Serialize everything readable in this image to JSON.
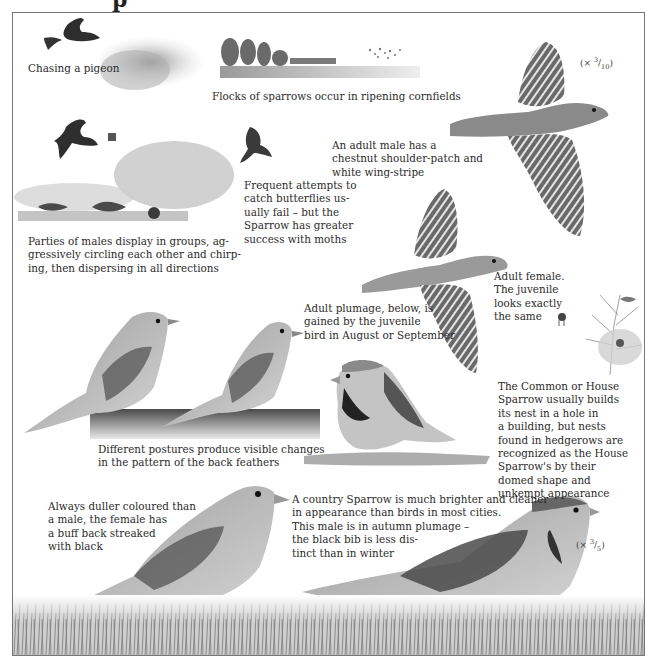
{
  "page": {
    "title_fragment": "p",
    "kind": "Field guide illustrated plate: House Sparrow"
  },
  "captions": {
    "chasing_pigeon": "Chasing a pigeon",
    "flocks_cornfields": "Flocks of sparrows occur in ripening cornfields",
    "adult_male_flight": [
      "An adult male has a",
      "chestnut shoulder-patch and",
      "white wing-stripe"
    ],
    "butterflies": [
      "Frequent attempts to",
      "catch butterflies us-",
      "ually fail – but the",
      "Sparrow has greater",
      "success with moths"
    ],
    "parties_males": [
      "Parties of males display in groups, ag-",
      "gressively circling each other and chirp-",
      "ing, then dispersing in all directions"
    ],
    "adult_female_flight": [
      "Adult female.",
      "The juvenile",
      "looks exactly",
      "the same"
    ],
    "adult_plumage": [
      "Adult plumage, below, is",
      "gained by the juvenile",
      "bird in August or September"
    ],
    "nest": [
      "The Common or House",
      "Sparrow usually builds",
      "its nest in a hole in",
      "a building, but nests",
      "found in hedgerows are",
      "recognized as the House",
      "Sparrow's by their",
      "domed shape and",
      "unkempt appearance"
    ],
    "postures": [
      "Different postures produce visible changes",
      "in the pattern of the back feathers"
    ],
    "female_duller": [
      "Always duller coloured than",
      "a male, the female has",
      "a buff back streaked",
      "with black"
    ],
    "country_sparrow": [
      "A country Sparrow is much brighter and cleaner",
      "in appearance than birds in most cities.",
      "This male is in autumn plumage –",
      "the black bib is less dis-",
      "tinct than in winter"
    ]
  },
  "scales": {
    "top": {
      "prefix": "(× ",
      "num": "3",
      "den": "10",
      "suffix": ")"
    },
    "bottom": {
      "prefix": "(× ",
      "num": "3",
      "den": "5",
      "suffix": ")"
    }
  },
  "illustrations": [
    "sparrow-chasing-pigeon",
    "flock-over-cornfield-landscape",
    "males-display-group",
    "sparrow-catching-butterfly",
    "adult-male-in-flight",
    "adult-female-in-flight",
    "two-sparrows-on-post",
    "male-sparrow-perched",
    "hedgerow-nest",
    "female-sparrow-on-grass",
    "male-sparrow-autumn-on-grass"
  ],
  "colors": {
    "ink": "#2b2b2b",
    "frame": "#777777",
    "paper": "#ffffff"
  }
}
